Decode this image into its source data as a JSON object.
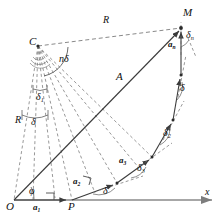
{
  "figure": {
    "colors": {
      "solid_line": "#3b3b3b",
      "dashed_line": "#6b6b6b",
      "axis_line": "#8a8a8a",
      "text": "#111111"
    }
  },
  "points": {
    "origin": "O",
    "center": "C",
    "start": "P",
    "end": "M"
  },
  "labels": {
    "radius_top": "R",
    "radius_left": "R",
    "amplitude": "A",
    "total_angle": "nδ",
    "axis_x": "x",
    "angle_phi": "φ",
    "delta_plain": "δ",
    "delta_center": "δ",
    "delta_lower_center": "δ",
    "delta_base": "δ"
  },
  "segments": [
    {
      "name": "a1",
      "base": "a",
      "sub": "1"
    },
    {
      "name": "a2",
      "base": "a",
      "sub": "2"
    },
    {
      "name": "a3",
      "base": "a",
      "sub": "3"
    },
    {
      "name": "an",
      "base": "a",
      "sub": "n"
    }
  ],
  "angle_marks": [
    {
      "name": "delta1",
      "base": "δ",
      "sub": "1"
    },
    {
      "name": "delta2",
      "base": "δ",
      "sub": "2"
    },
    {
      "name": "delta3",
      "base": "δ",
      "sub": "3"
    },
    {
      "name": "deltan",
      "base": "δ",
      "sub": "n"
    }
  ],
  "geometry": {
    "O": [
      14,
      200
    ],
    "P": [
      72,
      200
    ],
    "C": [
      38,
      46
    ],
    "M": [
      181,
      28
    ],
    "chain": [
      [
        72,
        200
      ],
      [
        117,
        183
      ],
      [
        152,
        157
      ],
      [
        173,
        120
      ],
      [
        181,
        75
      ],
      [
        181,
        28
      ]
    ],
    "axis_end": [
      216,
      200
    ]
  }
}
